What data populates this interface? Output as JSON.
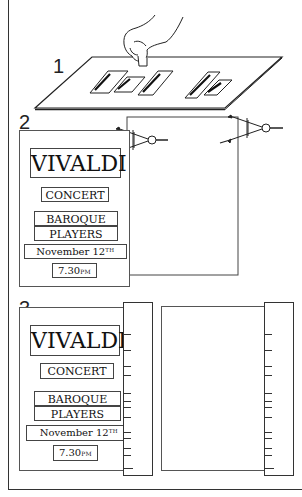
{
  "steps": [
    {
      "number": "1",
      "description": "Paste-up strips arranged on board, hand positioning a strip"
    },
    {
      "number": "2",
      "description": "Layout transferred to sheet using dividers"
    },
    {
      "number": "3",
      "description": "Measurements marked onto ruler strip and copied to blank sheet"
    }
  ],
  "poster": {
    "title": "VIVALDI",
    "subtitle": "CONCERT",
    "line3": "BAROQUE",
    "line4": "PLAYERS",
    "date_main": "November 12",
    "date_suffix": "TH",
    "time_main": "7.30",
    "time_suffix": "PM"
  },
  "board_strips": [
    "VIVALDI",
    "CONCERT",
    "BAROQUE",
    "November 12th",
    "7.30pm"
  ],
  "colors": {
    "ink": "#222222",
    "paper": "#ffffff"
  }
}
